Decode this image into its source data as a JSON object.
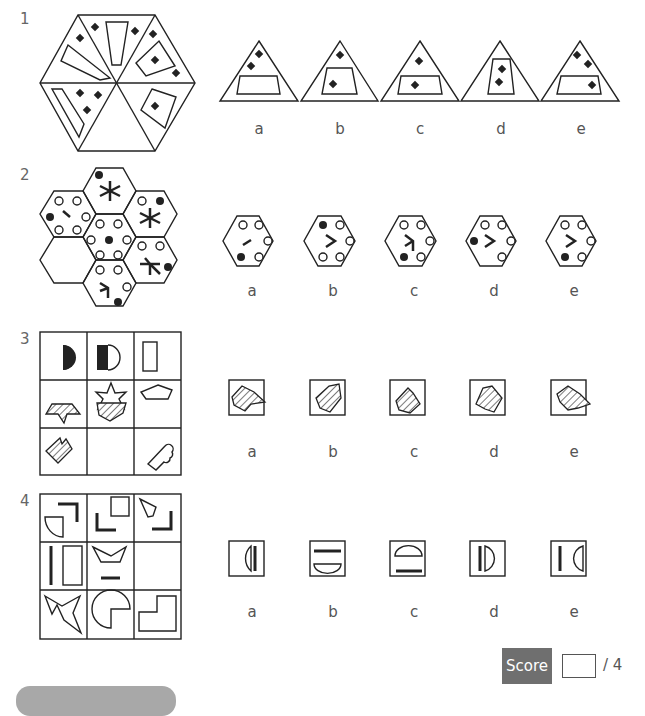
{
  "questions": [
    {
      "number": "1",
      "type": "hexagon-segments",
      "options": [
        "a",
        "b",
        "c",
        "d",
        "e"
      ]
    },
    {
      "number": "2",
      "type": "hexagon-honeycomb",
      "options": [
        "a",
        "b",
        "c",
        "d",
        "e"
      ]
    },
    {
      "number": "3",
      "type": "3x3-grid-rotation",
      "options": [
        "a",
        "b",
        "c",
        "d",
        "e"
      ]
    },
    {
      "number": "4",
      "type": "3x3-grid-shapes",
      "options": [
        "a",
        "b",
        "c",
        "d",
        "e"
      ]
    }
  ],
  "score": {
    "label": "Score",
    "value": "",
    "total": "/ 4"
  }
}
